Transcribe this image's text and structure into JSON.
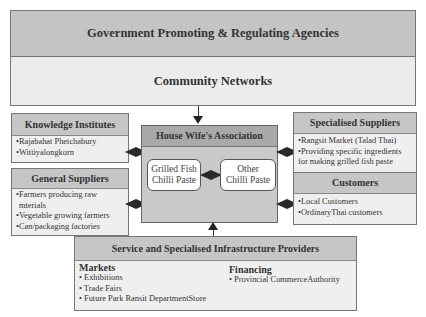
{
  "title": "Government Promoting & Regulating Agencies",
  "community": "Community Networks",
  "knowledge_institutes": {
    "title": "Knowledge Institutes",
    "items": [
      "•Rajabahat Phetchabury",
      "•Wittiyalongkorn"
    ]
  },
  "general_suppliers": {
    "title": "General Suppliers",
    "items": [
      "•Farmers producing raw",
      " mterials",
      "•Vegetable growing farmers",
      "•Can/packaging factories"
    ]
  },
  "center": {
    "title": "House Wife's Association",
    "left_product": "Grilled Fish Chilli Paste",
    "left_product_lines": [
      "Grilled Fish",
      "Chilli Paste"
    ],
    "right_product_lines": [
      "Other",
      "Chilli Paste"
    ]
  },
  "specialised_suppliers": {
    "title": "Specialised Suppliers",
    "items": [
      "•Rangsit Market (Talad Thai)",
      "•Providing specific ingredients",
      "for making grilled fish paste"
    ]
  },
  "customers": {
    "title": "Customers",
    "items": [
      "•Local Customers",
      "•OrdinaryThai customers"
    ]
  },
  "infrastructure": {
    "title": "Service and Specialised Infrastructure Providers",
    "markets": {
      "title": "Markets",
      "items": [
        "• Exhibitions",
        "• Trade Fairs",
        "• Future Park Ransit DepartmentStore"
      ]
    },
    "financing": {
      "title": "Financing",
      "items": [
        "• Provincial CommerceAuthority"
      ]
    }
  },
  "colors": {
    "header_fill": "#c6c6c6",
    "body_fill": "#efefef",
    "center_fill": "#c9c9c9",
    "connector": "#2a2a2a"
  }
}
